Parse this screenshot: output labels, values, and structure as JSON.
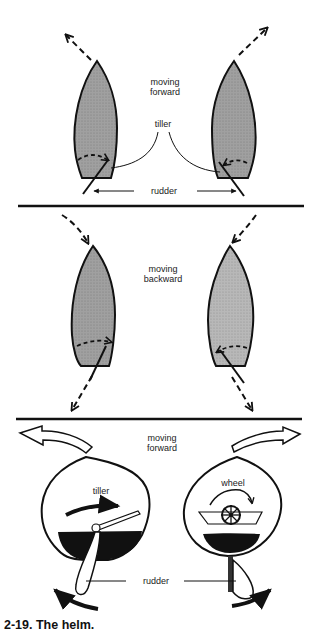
{
  "figure": {
    "caption": "2-19. The helm.",
    "panels": [
      {
        "id": "forward-tiller-top",
        "labels": {
          "direction_line1": "moving",
          "direction_line2": "forward",
          "tiller": "tiller",
          "rudder": "rudder"
        }
      },
      {
        "id": "backward",
        "labels": {
          "direction_line1": "moving",
          "direction_line2": "backward"
        }
      },
      {
        "id": "forward-perspective",
        "labels": {
          "direction_line1": "moving",
          "direction_line2": "forward",
          "tiller": "tiller",
          "wheel": "wheel",
          "rudder": "rudder"
        }
      }
    ]
  },
  "colors": {
    "hull_fill": "#9a9a9a",
    "hull_fill_light": "#b4b4b4",
    "ink": "#111111",
    "background": "#ffffff"
  }
}
